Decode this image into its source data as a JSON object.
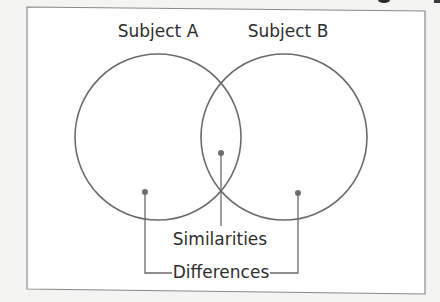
{
  "diagram": {
    "type": "venn",
    "subjects": [
      {
        "label": "Subject A",
        "cx": 158,
        "cy": 137,
        "r": 84,
        "label_x": 158,
        "label_y": 36
      },
      {
        "label": "Subject B",
        "cx": 284,
        "cy": 137,
        "r": 84,
        "label_x": 288,
        "label_y": 36
      }
    ],
    "callouts": {
      "similarities": {
        "label": "Similarities",
        "x": 220,
        "y": 246
      },
      "differences": {
        "label": "Differences",
        "x": 220,
        "y": 278
      }
    },
    "colors": {
      "line": "#6a6a6a",
      "dot": "#6e6e6e",
      "text": "#2e2e2e",
      "frame": "#8a8a8a",
      "frame_fill": "#ffffff",
      "background": "#f4f4f3"
    }
  }
}
